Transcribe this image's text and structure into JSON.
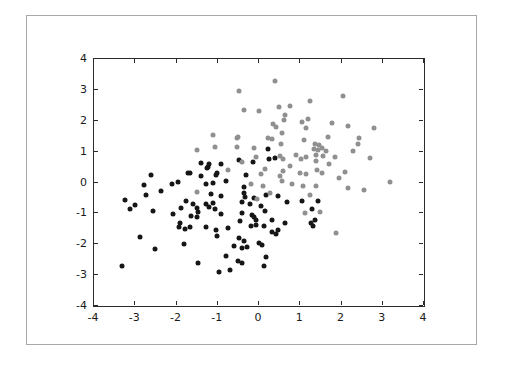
{
  "figure": {
    "background_color": "#ffffff",
    "frame_border_color": "#a8a8a8",
    "axes_border_color": "#2b2b2b",
    "tick_label_color": "#1a1a1a"
  },
  "chart_data": {
    "type": "scatter",
    "title": "",
    "xlabel": "",
    "ylabel": "",
    "xlim": [
      -4,
      4
    ],
    "ylim": [
      -4,
      4
    ],
    "xticks": [
      -4,
      -3,
      -2,
      -1,
      0,
      1,
      2,
      3,
      4
    ],
    "yticks": [
      -4,
      -3,
      -2,
      -1,
      0,
      1,
      2,
      3,
      4
    ],
    "grid": false,
    "legend": "none",
    "marker_size_px": 5,
    "series": [
      {
        "name": "cluster-dark",
        "color": "#161616",
        "marker": "circle",
        "points": [
          [
            -3.3,
            -2.75
          ],
          [
            -2.85,
            -1.8
          ],
          [
            -2.5,
            -2.2
          ],
          [
            -1.8,
            -2.03
          ],
          [
            -1.45,
            -2.65
          ],
          [
            -2.6,
            0.22
          ],
          [
            -2.76,
            -0.12
          ],
          [
            -3.22,
            -0.61
          ],
          [
            -2.99,
            -0.76
          ],
          [
            -3.11,
            -0.9
          ],
          [
            -2.71,
            -0.44
          ],
          [
            -2.55,
            -0.96
          ],
          [
            -1.94,
            0.0
          ],
          [
            -2.08,
            -0.09
          ],
          [
            -2.34,
            -0.31
          ],
          [
            -1.66,
            0.29
          ],
          [
            -1.74,
            -0.63
          ],
          [
            -1.58,
            -0.74
          ],
          [
            -1.86,
            -0.85
          ],
          [
            -1.49,
            -0.85
          ],
          [
            -1.45,
            -0.98
          ],
          [
            -2.06,
            -1.04
          ],
          [
            -1.62,
            -1.12
          ],
          [
            -1.49,
            -1.15
          ],
          [
            -1.9,
            -1.33
          ],
          [
            -1.37,
            0.59
          ],
          [
            -1.21,
            0.47
          ],
          [
            -0.89,
            0.58
          ],
          [
            -1.7,
            0.28
          ],
          [
            -1.37,
            0.17
          ],
          [
            -1.01,
            0.2
          ],
          [
            -0.28,
            0.2
          ],
          [
            -1.19,
            0.56
          ],
          [
            -0.99,
            0.29
          ],
          [
            -1.24,
            0.45
          ],
          [
            -1.27,
            -0.07
          ],
          [
            -1.09,
            -0.04
          ],
          [
            -0.78,
            0.02
          ],
          [
            -0.35,
            -0.18
          ],
          [
            -1.13,
            -0.42
          ],
          [
            -0.89,
            -0.47
          ],
          [
            -0.35,
            -0.36
          ],
          [
            -0.32,
            -0.5
          ],
          [
            -0.1,
            -0.54
          ],
          [
            0.2,
            -0.44
          ],
          [
            0.48,
            -0.48
          ],
          [
            -1.09,
            -0.69
          ],
          [
            -1.27,
            -0.74
          ],
          [
            -1.19,
            -0.83
          ],
          [
            -1.04,
            -0.89
          ],
          [
            -0.38,
            -0.65
          ],
          [
            -0.2,
            -0.74
          ],
          [
            0.08,
            -0.79
          ],
          [
            0.7,
            -0.68
          ],
          [
            1.06,
            -0.62
          ],
          [
            1.46,
            -0.62
          ],
          [
            -0.89,
            -1.04
          ],
          [
            -0.4,
            -1.03
          ],
          [
            -0.15,
            -1.07
          ],
          [
            -0.09,
            -1.16
          ],
          [
            -0.06,
            -1.26
          ],
          [
            -0.44,
            -1.28
          ],
          [
            0.16,
            -0.96
          ],
          [
            0.33,
            -1.24
          ],
          [
            0.65,
            -1.33
          ],
          [
            1.32,
            -0.88
          ],
          [
            1.37,
            -1.25
          ],
          [
            1.29,
            -1.33
          ],
          [
            1.34,
            -1.43
          ],
          [
            -1.91,
            -1.46
          ],
          [
            -1.78,
            -1.54
          ],
          [
            -1.66,
            -1.48
          ],
          [
            -1.26,
            -1.47
          ],
          [
            -1.02,
            -1.56
          ],
          [
            -1.0,
            -1.78
          ],
          [
            -0.73,
            -1.5
          ],
          [
            -0.17,
            -1.43
          ],
          [
            -0.06,
            -1.4
          ],
          [
            0.14,
            -1.44
          ],
          [
            0.33,
            -1.65
          ],
          [
            0.43,
            -1.7
          ],
          [
            0.48,
            -1.58
          ],
          [
            -0.46,
            -1.82
          ],
          [
            -0.35,
            -1.94
          ],
          [
            -0.57,
            -2.08
          ],
          [
            -0.38,
            -2.15
          ],
          [
            -0.27,
            -2.11
          ],
          [
            0.02,
            -2.0
          ],
          [
            0.1,
            -2.06
          ],
          [
            -0.77,
            -2.4
          ],
          [
            -0.48,
            -2.59
          ],
          [
            -0.38,
            -2.65
          ],
          [
            0.2,
            -2.43
          ],
          [
            0.14,
            -2.73
          ],
          [
            -0.95,
            -2.94
          ],
          [
            -0.67,
            -2.87
          ],
          [
            0.25,
            1.05
          ],
          [
            0.27,
            0.72
          ],
          [
            0.4,
            0.77
          ],
          [
            -0.45,
            0.7
          ],
          [
            -0.12,
            0.64
          ]
        ]
      },
      {
        "name": "cluster-gray",
        "color": "#909090",
        "marker": "circle",
        "points": [
          [
            0.4,
            3.24
          ],
          [
            -0.46,
            2.92
          ],
          [
            2.05,
            2.78
          ],
          [
            -0.33,
            2.33
          ],
          [
            0.02,
            2.29
          ],
          [
            0.51,
            2.4
          ],
          [
            0.77,
            2.46
          ],
          [
            1.25,
            2.6
          ],
          [
            0.66,
            2.14
          ],
          [
            0.64,
            2.0
          ],
          [
            0.36,
            1.85
          ],
          [
            0.43,
            1.75
          ],
          [
            1.07,
            1.92
          ],
          [
            1.2,
            2.02
          ],
          [
            -1.08,
            1.5
          ],
          [
            -0.48,
            1.44
          ],
          [
            0.25,
            1.41
          ],
          [
            0.33,
            1.38
          ],
          [
            0.57,
            1.57
          ],
          [
            1.17,
            1.73
          ],
          [
            1.11,
            1.35
          ],
          [
            1.8,
            1.9
          ],
          [
            2.19,
            1.8
          ],
          [
            2.45,
            1.4
          ],
          [
            2.8,
            1.73
          ],
          [
            1.7,
            1.44
          ],
          [
            -1.47,
            1.03
          ],
          [
            -1.05,
            1.11
          ],
          [
            -0.52,
            1.11
          ],
          [
            -0.09,
            1.1
          ],
          [
            -0.51,
            1.41
          ],
          [
            0.55,
            1.22
          ],
          [
            1.37,
            1.23
          ],
          [
            1.49,
            1.18
          ],
          [
            1.35,
            1.04
          ],
          [
            1.45,
            1.01
          ],
          [
            1.56,
            1.07
          ],
          [
            1.66,
            0.99
          ],
          [
            1.41,
            0.86
          ],
          [
            1.58,
            0.83
          ],
          [
            2.42,
            1.23
          ],
          [
            2.3,
            0.99
          ],
          [
            1.86,
            0.79
          ],
          [
            2.71,
            0.77
          ],
          [
            1.72,
            0.58
          ],
          [
            1.4,
            0.66
          ],
          [
            1.43,
            0.36
          ],
          [
            1.56,
            0.29
          ],
          [
            2.1,
            0.32
          ],
          [
            1.96,
            0.1
          ],
          [
            3.19,
            -0.01
          ],
          [
            2.17,
            -0.22
          ],
          [
            2.57,
            -0.28
          ],
          [
            1.88,
            -1.68
          ],
          [
            1.26,
            -0.44
          ],
          [
            1.5,
            -0.98
          ],
          [
            1.13,
            -1.02
          ],
          [
            1.4,
            -0.15
          ],
          [
            -0.04,
            0.79
          ],
          [
            0.16,
            0.39
          ],
          [
            0.08,
            0.23
          ],
          [
            0.61,
            0.34
          ],
          [
            0.77,
            0.5
          ],
          [
            0.53,
            0.18
          ],
          [
            1.01,
            0.29
          ],
          [
            1.16,
            0.23
          ],
          [
            0.53,
            0.83
          ],
          [
            0.61,
            0.72
          ],
          [
            0.93,
            0.86
          ],
          [
            1.05,
            0.72
          ],
          [
            1.17,
            0.79
          ],
          [
            -0.38,
            0.63
          ],
          [
            -0.73,
            0.38
          ],
          [
            -0.16,
            -0.09
          ],
          [
            0.12,
            -0.15
          ],
          [
            0.3,
            -0.36
          ],
          [
            0.57,
            0.02
          ],
          [
            0.83,
            -0.09
          ],
          [
            1.09,
            -0.15
          ],
          [
            -0.03,
            -0.56
          ],
          [
            -1.49,
            -0.33
          ]
        ]
      }
    ]
  }
}
